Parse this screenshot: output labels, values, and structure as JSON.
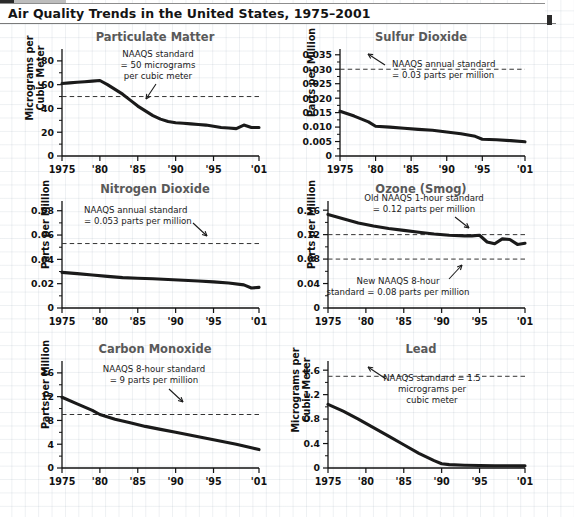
{
  "header": {
    "title": "Air Quality Trends in the United States, 1975–2001"
  },
  "source": {
    "text": "SOURCES: Council on Environmental Quality, Environmental Quality 1993: 24th Annual Report of the CEQ, Washington, D.C., April 1995; and U.S. Environmental Protection Agency, National Air Quality and Emissions Trends, various years, available at http://www.epa.gov. Special thanks to Joe Elkins of the U.S. Environmental Protection Agency for assistance in obtaining the latest air quality data."
  },
  "chart_data": [
    {
      "type": "line",
      "title": "Particulate Matter",
      "ylabel": "Micrograms per\nCubic Meter",
      "xlabel": "",
      "ylim": [
        0,
        90
      ],
      "yticks": [
        0,
        20,
        40,
        60,
        80
      ],
      "ytick_labels": [
        "0",
        "20",
        "40",
        "60",
        "80"
      ],
      "xlim": [
        1975,
        2001
      ],
      "xticks": [
        1975,
        1980,
        1985,
        1990,
        1995,
        2001
      ],
      "xtick_labels": [
        "1975",
        "'80",
        "'85",
        "'90",
        "'95",
        "'01"
      ],
      "grid": false,
      "standard": {
        "value": 50,
        "label": "NAAQS standard\n= 50 micrograms\nper cubic meter"
      },
      "x": [
        1975,
        1976,
        1977,
        1978,
        1979,
        1980,
        1981,
        1982,
        1983,
        1984,
        1985,
        1986,
        1987,
        1988,
        1989,
        1990,
        1991,
        1992,
        1993,
        1994,
        1995,
        1996,
        1997,
        1998,
        1999,
        2000,
        2001
      ],
      "values": [
        61,
        61.5,
        62,
        62.5,
        63,
        63.5,
        60,
        56,
        52,
        47,
        42,
        38,
        34,
        31,
        29,
        28,
        27.5,
        27,
        26.5,
        26,
        25,
        24,
        23.5,
        23,
        26,
        24,
        24
      ]
    },
    {
      "type": "line",
      "title": "Sulfur Dioxide",
      "ylabel": "Parts per Million",
      "xlabel": "",
      "ylim": [
        0,
        0.037
      ],
      "yticks": [
        0,
        0.005,
        0.01,
        0.015,
        0.02,
        0.025,
        0.03,
        0.035
      ],
      "ytick_labels": [
        "0",
        "0.005",
        "0.010",
        "0.015",
        "0.020",
        "0.025",
        "0.030",
        "0.035"
      ],
      "xlim": [
        1975,
        2001
      ],
      "xticks": [
        1975,
        1980,
        1985,
        1990,
        1995,
        2001
      ],
      "xtick_labels": [
        "1975",
        "'80",
        "'85",
        "'90",
        "'95",
        "'01"
      ],
      "grid": false,
      "standard": {
        "value": 0.03,
        "label": "NAAQS annual standard\n= 0.03 parts per million"
      },
      "x": [
        1975,
        1977,
        1979,
        1980,
        1982,
        1984,
        1986,
        1988,
        1990,
        1992,
        1994,
        1995,
        1997,
        1999,
        2001
      ],
      "values": [
        0.0155,
        0.0138,
        0.0118,
        0.0103,
        0.01,
        0.0096,
        0.0092,
        0.0089,
        0.0083,
        0.0077,
        0.0068,
        0.0058,
        0.0056,
        0.0053,
        0.0049
      ]
    },
    {
      "type": "line",
      "title": "Nitrogen Dioxide",
      "ylabel": "Parts per Million",
      "xlabel": "",
      "ylim": [
        0,
        0.088
      ],
      "yticks": [
        0,
        0.02,
        0.04,
        0.06,
        0.08
      ],
      "ytick_labels": [
        "0",
        "0.02",
        "0.04",
        "0.06",
        "0.08"
      ],
      "xlim": [
        1975,
        2001
      ],
      "xticks": [
        1975,
        1980,
        1985,
        1990,
        1995,
        2001
      ],
      "xtick_labels": [
        "1975",
        "'80",
        "'85",
        "'90",
        "'95",
        "'01"
      ],
      "grid": false,
      "standard": {
        "value": 0.053,
        "label": "NAAQS annual standard\n= 0.053 parts per million"
      },
      "x": [
        1975,
        1977,
        1979,
        1981,
        1983,
        1985,
        1987,
        1989,
        1991,
        1993,
        1995,
        1997,
        1999,
        2000,
        2001
      ],
      "values": [
        0.0293,
        0.0283,
        0.0272,
        0.026,
        0.025,
        0.0245,
        0.024,
        0.0234,
        0.0228,
        0.0222,
        0.0215,
        0.0205,
        0.019,
        0.0165,
        0.017
      ]
    },
    {
      "type": "line",
      "title": "Ozone (Smog)",
      "ylabel": "Parts per Million",
      "xlabel": "",
      "ylim": [
        0,
        0.175
      ],
      "yticks": [
        0,
        0.04,
        0.08,
        0.12,
        0.16
      ],
      "ytick_labels": [
        "0",
        "0.04",
        "0.08",
        "0.12",
        "0.16"
      ],
      "xlim": [
        1975,
        2001
      ],
      "xticks": [
        1975,
        1980,
        1985,
        1990,
        1995,
        2001
      ],
      "xtick_labels": [
        "1975",
        "'80",
        "'85",
        "'90",
        "'95",
        "'01"
      ],
      "grid": false,
      "standards": [
        {
          "value": 0.12,
          "label": "Old NAAQS 1-hour standard\n= 0.12 parts per million"
        },
        {
          "value": 0.08,
          "label": "New NAAQS 8-hour\nstandard = 0.08 parts per million"
        }
      ],
      "x": [
        1975,
        1977,
        1979,
        1981,
        1983,
        1985,
        1987,
        1989,
        1991,
        1993,
        1994,
        1995,
        1996,
        1997,
        1998,
        1999,
        2000,
        2001
      ],
      "values": [
        0.153,
        0.146,
        0.139,
        0.134,
        0.13,
        0.127,
        0.124,
        0.121,
        0.119,
        0.118,
        0.118,
        0.119,
        0.108,
        0.105,
        0.113,
        0.112,
        0.104,
        0.106
      ]
    },
    {
      "type": "line",
      "title": "Carbon Monoxide",
      "ylabel": "Parts per Million",
      "xlabel": "",
      "ylim": [
        0,
        18
      ],
      "yticks": [
        0,
        4,
        8,
        12,
        16
      ],
      "ytick_labels": [
        "0",
        "4",
        "8",
        "12",
        "16"
      ],
      "xlim": [
        1975,
        2001
      ],
      "xticks": [
        1975,
        1980,
        1985,
        1990,
        1995,
        2001
      ],
      "xtick_labels": [
        "1975",
        "'80",
        "'85",
        "'90",
        "'95",
        "'01"
      ],
      "grid": false,
      "standard": {
        "value": 9,
        "label": "NAAQS 8-hour standard\n= 9 parts per million"
      },
      "x": [
        1975,
        1977,
        1979,
        1980,
        1982,
        1984,
        1986,
        1988,
        1990,
        1992,
        1994,
        1996,
        1998,
        2000,
        2001
      ],
      "values": [
        11.9,
        10.8,
        9.7,
        9.0,
        8.2,
        7.6,
        7.0,
        6.5,
        6.0,
        5.5,
        5.0,
        4.5,
        4.0,
        3.4,
        3.1
      ]
    },
    {
      "type": "line",
      "title": "Lead",
      "ylabel": "Micrograms per\nCubic Meter",
      "xlabel": "",
      "ylim": [
        0,
        1.75
      ],
      "yticks": [
        0,
        0.4,
        0.8,
        1.2,
        1.6
      ],
      "ytick_labels": [
        "0",
        "0.4",
        "0.8",
        "1.2",
        "1.6"
      ],
      "xlim": [
        1975,
        2001
      ],
      "xticks": [
        1975,
        1980,
        1985,
        1990,
        1995,
        2001
      ],
      "xtick_labels": [
        "1975",
        "'80",
        "'85",
        "'90",
        "'95",
        "'01"
      ],
      "grid": false,
      "standard": {
        "value": 1.5,
        "label": "NAAQS standard = 1.5\nmicrograms per\ncubic meter"
      },
      "x": [
        1975,
        1977,
        1979,
        1981,
        1983,
        1985,
        1987,
        1989,
        1990,
        1991,
        1993,
        1995,
        1997,
        1999,
        2001
      ],
      "values": [
        1.04,
        0.93,
        0.8,
        0.66,
        0.52,
        0.38,
        0.24,
        0.12,
        0.07,
        0.055,
        0.045,
        0.04,
        0.038,
        0.036,
        0.035
      ]
    }
  ]
}
